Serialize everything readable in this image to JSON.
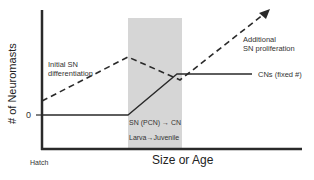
{
  "axes": {
    "y_label": "# of Neuromasts",
    "x_label": "Size or Age",
    "y_zero_tick": "0",
    "x_origin_label": "Hatch"
  },
  "annotations": {
    "initial_sn": "Initial SN",
    "initial_sn_2": "differentiation",
    "additional_sn": "Additional",
    "additional_sn_2": "SN proliferation",
    "cns_fixed": "CNs (fixed #)",
    "sn_pcn_to_cn": "SN (PCN) → CN",
    "larva_juvenile": "Larva→Juvenile"
  },
  "colors": {
    "shaded_region": "#d6d6d6",
    "lines": "#2a2a2a"
  }
}
